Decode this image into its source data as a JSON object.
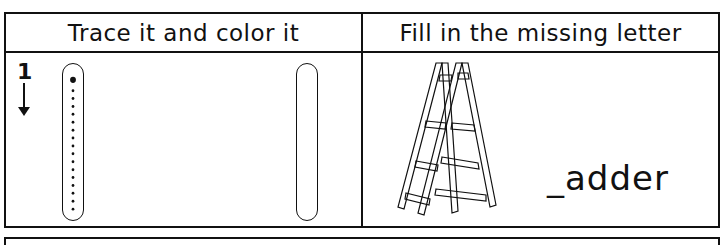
{
  "worksheet": {
    "left_header": "Trace it and color it",
    "right_header": "Fill in the missing letter",
    "trace": {
      "stroke_number": "1",
      "stroke_direction": "down",
      "dot_count": 17
    },
    "missing_letter": {
      "word": "_adder",
      "picture": "ladder-icon"
    }
  },
  "colors": {
    "ink": "#111111",
    "background": "#ffffff"
  }
}
